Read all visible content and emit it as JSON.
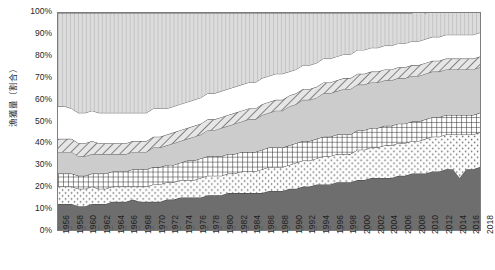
{
  "chart_data": {
    "type": "area",
    "title": "",
    "subtitle": "",
    "xlabel": "",
    "ylabel": "漁獲量（割合）",
    "stacked": true,
    "normalized_percent": true,
    "grid": false,
    "legend": "none",
    "ylim": [
      0,
      100
    ],
    "ytick_labels": [
      "100%",
      "90%",
      "80%",
      "70%",
      "60%",
      "50%",
      "40%",
      "30%",
      "20%",
      "10%",
      "0%"
    ],
    "ytick_values": [
      100,
      90,
      80,
      70,
      60,
      50,
      40,
      30,
      20,
      10,
      0
    ],
    "xtick_labels": [
      "1956",
      "1958",
      "1960",
      "1962",
      "1964",
      "1966",
      "1968",
      "1970",
      "1972",
      "1974",
      "1976",
      "1978",
      "1980",
      "1982",
      "1984",
      "1986",
      "1988",
      "1990",
      "1992",
      "1994",
      "1996",
      "1998",
      "2000",
      "2002",
      "2004",
      "2006",
      "2008",
      "2010",
      "2012",
      "2014",
      "2016",
      "2018"
    ],
    "x": [
      1956,
      1957,
      1958,
      1959,
      1960,
      1961,
      1962,
      1963,
      1964,
      1965,
      1966,
      1967,
      1968,
      1969,
      1970,
      1971,
      1972,
      1973,
      1974,
      1975,
      1976,
      1977,
      1978,
      1979,
      1980,
      1981,
      1982,
      1983,
      1984,
      1985,
      1986,
      1987,
      1988,
      1989,
      1990,
      1991,
      1992,
      1993,
      1994,
      1995,
      1996,
      1997,
      1998,
      1999,
      2000,
      2001,
      2002,
      2003,
      2004,
      2005,
      2006,
      2007,
      2008,
      2009,
      2010,
      2011,
      2012,
      2013,
      2014,
      2015,
      2016,
      2017,
      2018
    ],
    "xlim": [
      1956,
      2018
    ],
    "series": [
      {
        "name": "series-1",
        "pattern": "solid-dark",
        "color": "#6e6e6e",
        "values": [
          12,
          12,
          12,
          11,
          11,
          12,
          12,
          12,
          13,
          13,
          13,
          14,
          13,
          13,
          13,
          13,
          14,
          14,
          15,
          15,
          15,
          15,
          16,
          16,
          16,
          17,
          17,
          17,
          17,
          17,
          17,
          18,
          18,
          18,
          19,
          19,
          20,
          20,
          21,
          21,
          21,
          22,
          22,
          22,
          23,
          23,
          24,
          24,
          24,
          24,
          25,
          25,
          26,
          26,
          26,
          27,
          27,
          28,
          28,
          24,
          28,
          28,
          29
        ]
      },
      {
        "name": "series-2",
        "pattern": "dotted-white",
        "color": "#ffffff",
        "values": [
          8,
          8,
          8,
          8,
          8,
          8,
          7,
          7,
          7,
          7,
          7,
          6,
          7,
          7,
          8,
          8,
          8,
          8,
          8,
          8,
          8,
          9,
          9,
          9,
          9,
          9,
          9,
          10,
          10,
          10,
          11,
          11,
          11,
          11,
          11,
          12,
          12,
          12,
          12,
          13,
          13,
          13,
          13,
          13,
          14,
          14,
          14,
          14,
          15,
          15,
          15,
          15,
          15,
          15,
          16,
          16,
          16,
          16,
          16,
          20,
          16,
          16,
          16
        ]
      },
      {
        "name": "series-3",
        "pattern": "crosshatch-grid",
        "color": "#ffffff",
        "values": [
          6,
          6,
          6,
          6,
          6,
          6,
          7,
          7,
          7,
          7,
          7,
          8,
          8,
          8,
          8,
          8,
          8,
          8,
          8,
          9,
          9,
          9,
          9,
          9,
          9,
          9,
          9,
          9,
          9,
          9,
          9,
          9,
          9,
          9,
          9,
          9,
          9,
          9,
          9,
          9,
          9,
          9,
          9,
          9,
          9,
          9,
          9,
          9,
          9,
          9,
          9,
          9,
          9,
          9,
          9,
          9,
          9,
          9,
          9,
          9,
          9,
          9,
          9
        ]
      },
      {
        "name": "series-4",
        "pattern": "solid-light",
        "color": "#cccccc",
        "values": [
          10,
          10,
          10,
          9,
          9,
          9,
          9,
          9,
          8,
          8,
          8,
          8,
          8,
          8,
          9,
          9,
          9,
          10,
          10,
          10,
          11,
          11,
          12,
          12,
          13,
          13,
          14,
          14,
          15,
          15,
          16,
          16,
          17,
          17,
          18,
          18,
          19,
          19,
          19,
          20,
          20,
          20,
          21,
          21,
          21,
          21,
          21,
          21,
          21,
          21,
          21,
          21,
          21,
          21,
          21,
          21,
          21,
          21,
          21,
          21,
          21,
          21,
          21
        ]
      },
      {
        "name": "series-5",
        "pattern": "diagonal-hatch",
        "color": "#e2e2e2",
        "values": [
          6,
          6,
          6,
          6,
          6,
          6,
          5,
          5,
          5,
          5,
          5,
          5,
          5,
          5,
          5,
          5,
          5,
          5,
          5,
          5,
          5,
          5,
          5,
          5,
          5,
          5,
          5,
          5,
          5,
          5,
          5,
          5,
          5,
          5,
          5,
          5,
          5,
          5,
          5,
          5,
          5,
          5,
          5,
          5,
          5,
          5,
          5,
          5,
          5,
          5,
          5,
          5,
          5,
          5,
          5,
          5,
          5,
          5,
          5,
          5,
          5,
          5,
          5
        ]
      },
      {
        "name": "series-6",
        "pattern": "white-gap",
        "color": "#ffffff",
        "values": [
          15,
          15,
          14,
          14,
          14,
          14,
          14,
          14,
          14,
          14,
          14,
          13,
          13,
          13,
          13,
          13,
          12,
          12,
          12,
          12,
          12,
          12,
          12,
          12,
          12,
          12,
          12,
          12,
          12,
          12,
          12,
          12,
          12,
          12,
          11,
          11,
          11,
          11,
          11,
          11,
          11,
          11,
          11,
          11,
          11,
          11,
          11,
          11,
          11,
          11,
          11,
          11,
          11,
          11,
          11,
          11,
          11,
          11,
          11,
          11,
          11,
          11,
          11
        ]
      },
      {
        "name": "series-7",
        "pattern": "vertical-lines",
        "color": "#d9d9d9",
        "values": [
          43,
          43,
          44,
          46,
          46,
          45,
          46,
          46,
          46,
          46,
          46,
          46,
          46,
          46,
          44,
          44,
          44,
          43,
          42,
          41,
          40,
          39,
          37,
          37,
          36,
          35,
          34,
          33,
          32,
          32,
          30,
          29,
          28,
          28,
          27,
          26,
          24,
          24,
          23,
          21,
          21,
          20,
          19,
          19,
          17,
          17,
          16,
          16,
          15,
          15,
          14,
          14,
          13,
          14,
          12,
          12,
          12,
          11,
          11,
          12,
          11,
          11,
          10
        ]
      }
    ]
  }
}
